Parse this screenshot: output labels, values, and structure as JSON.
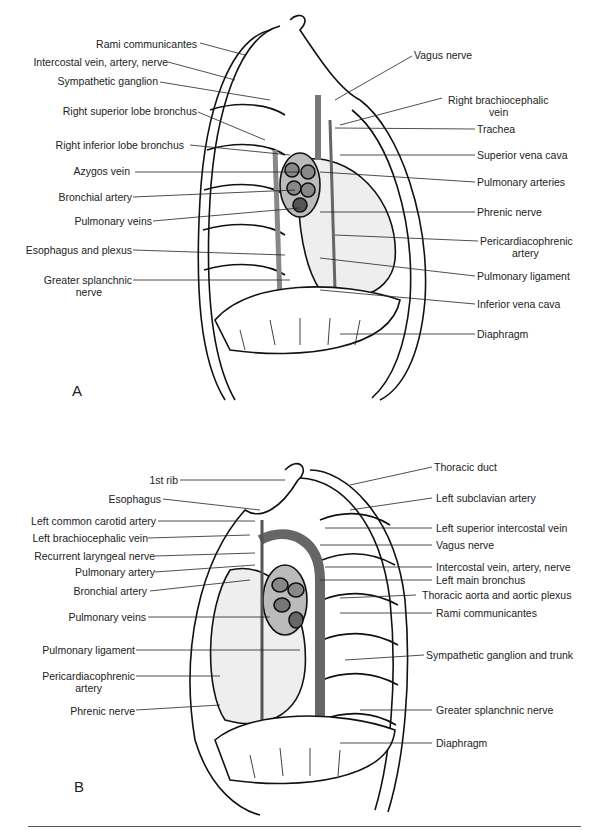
{
  "figure": {
    "panel_a": {
      "letter": "A",
      "left_labels": [
        "Rami communicantes",
        "Intercostal vein, artery, nerve",
        "Sympathetic ganglion",
        "Right superior lobe bronchus",
        "Right inferior lobe bronchus",
        "Azygos vein",
        "Bronchial artery",
        "Pulmonary veins",
        "Esophagus and plexus",
        "Greater splanchnic",
        "nerve"
      ],
      "right_labels": [
        "Vagus nerve",
        "Right brachiocephalic",
        "vein",
        "Trachea",
        "Superior vena cava",
        "Pulmonary arteries",
        "Phrenic nerve",
        "Pericardiacophrenic",
        "artery",
        "Pulmonary ligament",
        "Inferior vena cava",
        "Diaphragm"
      ]
    },
    "panel_b": {
      "letter": "B",
      "left_labels": [
        "1st rib",
        "Esophagus",
        "Left common carotid artery",
        "Left brachiocephalic vein",
        "Recurrent laryngeal nerve",
        "Pulmonary artery",
        "Bronchial artery",
        "Pulmonary veins",
        "Pulmonary ligament",
        "Pericardiacophrenic",
        "artery",
        "Phrenic nerve"
      ],
      "right_labels": [
        "Thoracic duct",
        "Left subclavian artery",
        "Left superior intercostal vein",
        "Vagus nerve",
        "Intercostal vein, artery, nerve",
        "Left main bronchus",
        "Thoracic aorta and aortic plexus",
        "Rami communicantes",
        "Sympathetic ganglion and trunk",
        "Greater splanchnic nerve",
        "Diaphragm"
      ]
    }
  }
}
